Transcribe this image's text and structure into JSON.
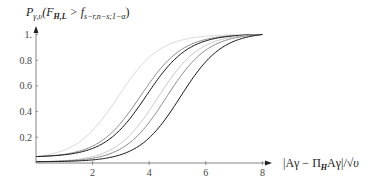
{
  "chart_data": {
    "type": "line",
    "title": "",
    "ylabel": "P_{γ,υ}(F_{H,L} > f_{s−r,n−s;1−α})",
    "ylabel_parts": {
      "main": "P",
      "sub": "γ,υ",
      "open": "(F",
      "sub2": "H,L",
      "mid": " > f",
      "sub3": "s−r,n−s;1−α",
      "close": ")"
    },
    "xlabel": "|Aγ − Π_H Aγ| / √υ",
    "xlabel_parts": {
      "left": "|Aγ − Π",
      "sub": "H",
      "right": "Aγ|/",
      "sqrt": "√υ"
    },
    "xlim": [
      0,
      8.6
    ],
    "ylim": [
      0,
      1.05
    ],
    "x_ticks": [
      "2",
      "4",
      "6",
      "8"
    ],
    "x_tick_values": [
      2,
      4,
      6,
      8
    ],
    "y_ticks": [
      "0.2",
      "0.4",
      "0.6",
      "0.8",
      "1."
    ],
    "y_tick_values": [
      0.2,
      0.4,
      0.6,
      0.8,
      1.0
    ],
    "grid": false,
    "legend": null,
    "series": [
      {
        "name": "curve-1",
        "group": "alpha-0.05",
        "color": "#d8d8d8",
        "start": 0.05,
        "midpoint": 2.9,
        "values_at": {
          "0": 0.05,
          "2": 0.22,
          "4": 0.83,
          "6": 0.99,
          "8": 1.0
        }
      },
      {
        "name": "curve-2",
        "group": "alpha-0.05",
        "color": "#8a8a8a",
        "start": 0.05,
        "midpoint": 3.7,
        "values_at": {
          "0": 0.05,
          "2": 0.13,
          "4": 0.58,
          "6": 0.95,
          "8": 1.0
        }
      },
      {
        "name": "curve-3",
        "group": "alpha-0.05",
        "color": "#111111",
        "start": 0.05,
        "midpoint": 3.9,
        "values_at": {
          "0": 0.05,
          "2": 0.11,
          "4": 0.52,
          "6": 0.93,
          "8": 1.0
        }
      },
      {
        "name": "curve-4",
        "group": "alpha-0.01",
        "color": "#c8c8c8",
        "start": 0.01,
        "midpoint": 4.3,
        "values_at": {
          "0": 0.01,
          "2": 0.06,
          "4": 0.42,
          "6": 0.88,
          "8": 0.99
        }
      },
      {
        "name": "curve-5",
        "group": "alpha-0.01",
        "color": "#8a8a8a",
        "start": 0.01,
        "midpoint": 4.6,
        "values_at": {
          "0": 0.01,
          "2": 0.05,
          "4": 0.35,
          "6": 0.83,
          "8": 0.99
        }
      },
      {
        "name": "curve-6",
        "group": "alpha-0.01",
        "color": "#111111",
        "start": 0.01,
        "midpoint": 5.1,
        "values_at": {
          "0": 0.01,
          "2": 0.03,
          "4": 0.25,
          "6": 0.72,
          "8": 0.98
        }
      }
    ]
  },
  "layout": {
    "origin_px": [
      36,
      163
    ],
    "x_px_per_unit": 28.3,
    "y_px_per_unit": 128.5
  }
}
